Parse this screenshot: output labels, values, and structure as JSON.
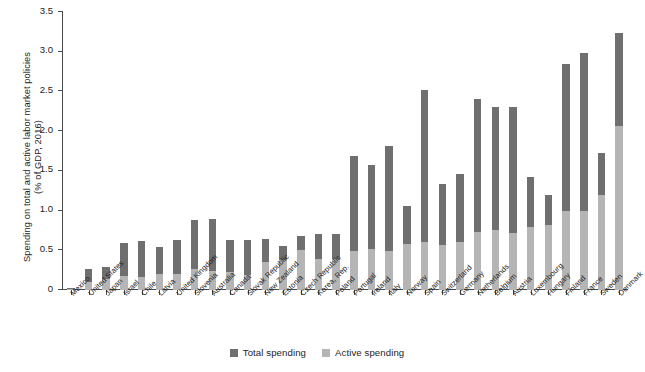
{
  "chart_data": {
    "type": "bar",
    "title": "",
    "subtitle": "",
    "xlabel": "",
    "ylabel": "Spending on total and active labor market policies (% of GDP, 2016)",
    "ylabel_lines": [
      "Spending on total and active labor market policies",
      "(% of GDP, 2016)"
    ],
    "ylim": [
      0,
      3.5
    ],
    "ytick_labels": [
      "0",
      "0.5",
      "1.0",
      "1.5",
      "2.0",
      "2.5",
      "3.0",
      "3.5"
    ],
    "ytick_values": [
      0,
      0.5,
      1.0,
      1.5,
      2.0,
      2.5,
      3.0,
      3.5
    ],
    "grid": false,
    "legend_position": "bottom-center",
    "stacked": true,
    "categories": [
      "Mexico",
      "United States",
      "Japan",
      "Israel",
      "Chile",
      "Latvia",
      "United Kingdom",
      "Slovenia",
      "Australia",
      "Canada",
      "Slovak Republic",
      "New Zealand",
      "Estonia",
      "Czech Republic",
      "Korea, Rep.",
      "Poland",
      "Portugal",
      "Ireland",
      "Italy",
      "Norway",
      "Spain",
      "Switzerland",
      "Germany",
      "Netherlands",
      "Belgium",
      "Austria",
      "Luxembourg",
      "Hungary",
      "Finland",
      "France",
      "Sweden",
      "Denmark"
    ],
    "series": [
      {
        "name": "Total spending",
        "color": "#6f6f6f",
        "values": [
          0.02,
          0.27,
          0.29,
          0.59,
          0.62,
          0.54,
          0.63,
          0.88,
          0.9,
          0.63,
          0.63,
          0.64,
          0.55,
          0.68,
          0.7,
          0.7,
          1.69,
          1.58,
          1.81,
          1.06,
          2.52,
          1.34,
          1.46,
          2.4,
          2.31,
          2.3,
          1.42,
          1.19,
          2.84,
          2.99,
          1.73,
          3.23
        ]
      },
      {
        "name": "Active spending",
        "color": "#b5b5b5",
        "values": [
          0.01,
          0.1,
          0.14,
          0.18,
          0.17,
          0.2,
          0.2,
          0.26,
          0.24,
          0.23,
          0.19,
          0.35,
          0.38,
          0.5,
          0.39,
          0.39,
          0.49,
          0.52,
          0.49,
          0.58,
          0.6,
          0.57,
          0.61,
          0.73,
          0.75,
          0.72,
          0.79,
          0.82,
          1.0,
          1.0,
          1.19,
          2.07
        ]
      }
    ]
  },
  "legend": {
    "items": [
      {
        "label": "Total spending",
        "color": "#6f6f6f",
        "swatch": "square-swatch"
      },
      {
        "label": "Active spending",
        "color": "#b5b5b5",
        "swatch": "square-swatch"
      }
    ]
  }
}
